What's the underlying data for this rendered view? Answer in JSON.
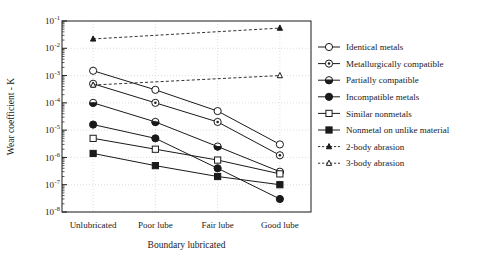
{
  "chart_data": {
    "type": "line",
    "title": "",
    "xlabel": "Boundary lubricated",
    "ylabel": "Wear coefficient - K",
    "categories": [
      "Unlubricated",
      "Poor lube",
      "Fair lube",
      "Good lube"
    ],
    "yscale": "log",
    "ylim": [
      1e-08,
      0.1
    ],
    "ytick_labels": [
      "10-1",
      "10-2",
      "10-3",
      "10-4",
      "10-5",
      "10-6",
      "10-7",
      "10-8"
    ],
    "ytick_mantissa": "10",
    "ytick_exponents": [
      "-1",
      "-2",
      "-3",
      "-4",
      "-5",
      "-6",
      "-7",
      "-8"
    ],
    "ytick_values": [
      0.1,
      0.01,
      0.001,
      0.0001,
      1e-05,
      1e-06,
      1e-07,
      1e-08
    ],
    "grid": true,
    "legend_position": "right",
    "series": [
      {
        "name": "Identical metals",
        "marker": "open-circle",
        "line": "solid",
        "x": [
          "Unlubricated",
          "Poor lube",
          "Fair lube",
          "Good lube"
        ],
        "values": [
          0.0015,
          0.0003,
          5e-05,
          3e-06
        ]
      },
      {
        "name": "Metallurgically compatible",
        "marker": "dot-circle",
        "line": "solid",
        "x": [
          "Unlubricated",
          "Poor lube",
          "Fair lube",
          "Good lube"
        ],
        "values": [
          0.0005,
          0.0001,
          2e-05,
          1.2e-06
        ]
      },
      {
        "name": "Partially compatible",
        "marker": "half-circle",
        "line": "solid",
        "x": [
          "Unlubricated",
          "Poor lube",
          "Fair lube",
          "Good lube"
        ],
        "values": [
          0.0001,
          2e-05,
          2.5e-06,
          3e-07
        ]
      },
      {
        "name": "Incompatible metals",
        "marker": "filled-circle",
        "line": "solid",
        "x": [
          "Unlubricated",
          "Poor lube",
          "Fair lube",
          "Good lube"
        ],
        "values": [
          1.6e-05,
          5e-06,
          4e-07,
          3e-08
        ]
      },
      {
        "name": "Similar nonmetals",
        "marker": "open-square",
        "line": "solid",
        "x": [
          "Unlubricated",
          "Poor lube",
          "Fair lube",
          "Good lube"
        ],
        "values": [
          5e-06,
          2e-06,
          8e-07,
          2.5e-07
        ]
      },
      {
        "name": "Nonmetal on unlike material",
        "marker": "filled-square",
        "line": "solid",
        "x": [
          "Unlubricated",
          "Poor lube",
          "Fair lube",
          "Good lube"
        ],
        "values": [
          1.4e-06,
          5e-07,
          2e-07,
          1e-07
        ]
      },
      {
        "name": "2-body abrasion",
        "marker": "filled-triangle",
        "line": "dashed",
        "x": [
          "Unlubricated",
          "Good lube"
        ],
        "values": [
          0.022,
          0.055
        ]
      },
      {
        "name": "3-body abrasion",
        "marker": "open-triangle",
        "line": "dashed",
        "x": [
          "Unlubricated",
          "Good lube"
        ],
        "values": [
          0.00045,
          0.001
        ]
      }
    ]
  },
  "legend": {
    "items": [
      {
        "label": "Identical metals",
        "marker": "open-circle",
        "line": "solid"
      },
      {
        "label": "Metallurgically compatible",
        "marker": "dot-circle",
        "line": "solid"
      },
      {
        "label": "Partially compatible",
        "marker": "half-circle",
        "line": "solid"
      },
      {
        "label": "Incompatible metals",
        "marker": "filled-circle",
        "line": "solid"
      },
      {
        "label": "Similar nonmetals",
        "marker": "open-square",
        "line": "solid"
      },
      {
        "label": "Nonmetal on unlike material",
        "marker": "filled-square",
        "line": "solid"
      },
      {
        "label": "2-body abrasion",
        "marker": "filled-triangle",
        "line": "dashed"
      },
      {
        "label": "3-body abrasion",
        "marker": "open-triangle",
        "line": "dashed"
      }
    ]
  },
  "colors": {
    "ink": "#1a1a1a",
    "grid": "#c8c8c8",
    "background": "#ffffff"
  }
}
